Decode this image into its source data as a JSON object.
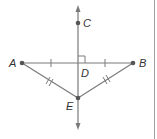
{
  "diagram": {
    "colors": {
      "line": "#7a7a7a",
      "point": "#555555",
      "label": "#333333",
      "border": "#a0a0a0"
    },
    "points": {
      "A": {
        "label": "A",
        "x": 22,
        "y": 63
      },
      "B": {
        "label": "B",
        "x": 133,
        "y": 63
      },
      "C": {
        "label": "C",
        "x": 78,
        "y": 23
      },
      "D": {
        "label": "D",
        "x": 78,
        "y": 63
      },
      "E": {
        "label": "E",
        "x": 78,
        "y": 98
      }
    },
    "segments": [
      {
        "from": "A",
        "to": "B",
        "tick_marks": 1,
        "note": "AD ≅ DB"
      },
      {
        "from": "A",
        "to": "E",
        "tick_marks": 2
      },
      {
        "from": "B",
        "to": "E",
        "tick_marks": 2
      }
    ],
    "lines": [
      {
        "through": [
          "C",
          "D",
          "E"
        ],
        "arrows": "both"
      }
    ],
    "right_angle": {
      "at": "D"
    }
  }
}
